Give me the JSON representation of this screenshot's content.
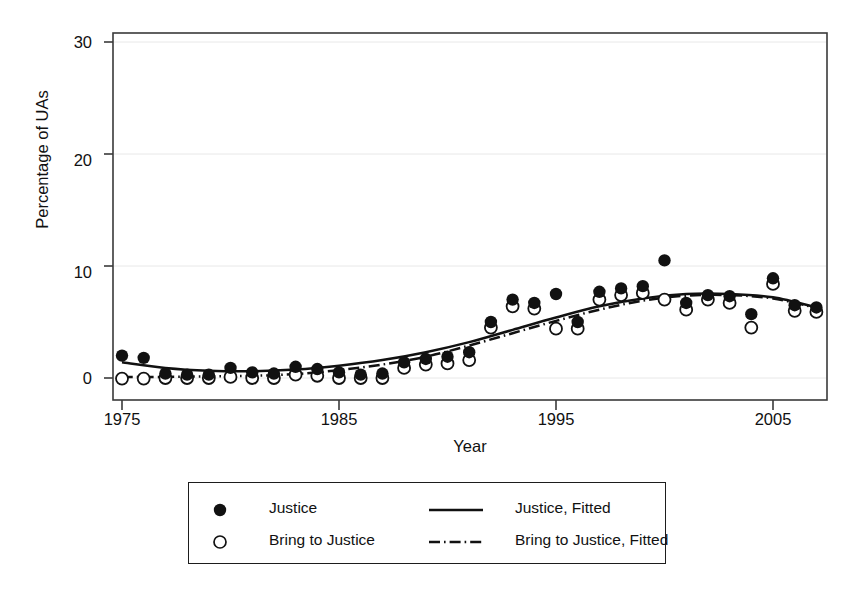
{
  "figure": {
    "background": "#ffffff",
    "foreground": "#1a1a1a",
    "gridline_color": "#e8e8e8"
  },
  "axes": {
    "ylabel": "Percentage of UAs",
    "xlabel": "Year",
    "yticks": [
      "0",
      "10",
      "20",
      "30"
    ],
    "xticks": [
      "1975",
      "1985",
      "1995",
      "2005"
    ]
  },
  "legend": {
    "entries": [
      {
        "label": "Justice",
        "key": "filled-circle-marker"
      },
      {
        "label": "Bring to Justice",
        "key": "open-circle-marker"
      },
      {
        "label": "Justice, Fitted",
        "key": "solid-line-key"
      },
      {
        "label": "Bring to Justice, Fitted",
        "key": "dash-dot-line-key"
      }
    ]
  },
  "caption": {
    "text": ""
  },
  "chart_data": {
    "type": "scatter",
    "title": "",
    "subtitle": "",
    "xlabel": "Year",
    "ylabel": "Percentage of UAs",
    "xlim": [
      1974.2,
      2007.2
    ],
    "ylim": [
      -1.2,
      31.5
    ],
    "yticks": [
      0,
      10,
      20,
      30
    ],
    "xticks": [
      1975,
      1985,
      1995,
      2005
    ],
    "grid": "horizontal-gridlines-at-yticks",
    "legend_position": "below-plot-outside",
    "series": [
      {
        "name": "Justice",
        "marker": "filled-circle",
        "x": [
          1975,
          1976,
          1977,
          1978,
          1979,
          1980,
          1981,
          1982,
          1983,
          1984,
          1985,
          1986,
          1987,
          1988,
          1989,
          1990,
          1991,
          1992,
          1993,
          1994,
          1995,
          1996,
          1997,
          1998,
          1999,
          2000,
          2001,
          2002,
          2003,
          2004,
          2005,
          2006,
          2007
        ],
        "values": [
          2.0,
          1.8,
          0.4,
          0.3,
          0.3,
          0.9,
          0.5,
          0.4,
          1.0,
          0.8,
          0.5,
          0.3,
          0.4,
          1.4,
          1.7,
          1.9,
          2.3,
          5.0,
          7.0,
          6.7,
          7.5,
          5.0,
          7.7,
          8.0,
          8.2,
          10.5,
          6.7,
          7.4,
          7.3,
          5.7,
          8.9,
          6.5,
          6.3
        ]
      },
      {
        "name": "Bring to Justice",
        "marker": "open-circle",
        "x": [
          1975,
          1976,
          1977,
          1978,
          1979,
          1980,
          1981,
          1982,
          1983,
          1984,
          1985,
          1986,
          1987,
          1988,
          1989,
          1990,
          1991,
          1992,
          1993,
          1994,
          1995,
          1996,
          1997,
          1998,
          1999,
          2000,
          2001,
          2002,
          2003,
          2004,
          2005,
          2006,
          2007
        ],
        "values": [
          -0.05,
          -0.05,
          0.0,
          0.0,
          0.0,
          0.1,
          0.0,
          0.0,
          0.3,
          0.2,
          0.0,
          0.0,
          0.0,
          0.9,
          1.2,
          1.3,
          1.6,
          4.5,
          6.4,
          6.2,
          4.4,
          4.4,
          7.0,
          7.4,
          7.6,
          7.0,
          6.1,
          7.0,
          6.7,
          4.5,
          8.4,
          6.0,
          5.9
        ]
      }
    ],
    "fits": [
      {
        "name": "Justice, Fitted",
        "style": "solid",
        "x": [
          1975,
          1977,
          1979,
          1981,
          1983,
          1985,
          1987,
          1989,
          1991,
          1993,
          1995,
          1997,
          1999,
          2001,
          2003,
          2005,
          2007
        ],
        "values": [
          1.4,
          0.9,
          0.65,
          0.6,
          0.75,
          1.1,
          1.6,
          2.3,
          3.2,
          4.3,
          5.4,
          6.4,
          7.1,
          7.5,
          7.5,
          7.2,
          6.3
        ]
      },
      {
        "name": "Bring to Justice, Fitted",
        "style": "dash-dot",
        "x": [
          1975,
          1977,
          1979,
          1981,
          1983,
          1985,
          1987,
          1989,
          1991,
          1993,
          1995,
          1997,
          1999,
          2001,
          2003,
          2005,
          2007
        ],
        "values": [
          0.1,
          0.1,
          0.15,
          0.2,
          0.35,
          0.7,
          1.2,
          1.9,
          2.9,
          4.0,
          5.1,
          6.1,
          6.9,
          7.35,
          7.4,
          7.1,
          6.25
        ]
      }
    ]
  }
}
